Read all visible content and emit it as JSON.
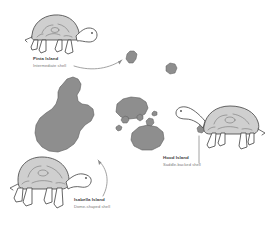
{
  "figure": {
    "type": "illustration-map",
    "background_color": "#ffffff",
    "island_fill_color": "#8e8e8e",
    "island_stroke_color": "#5d5d5d",
    "shell_fill_color": "#cfcfcf",
    "outline_color": "#4a4a4a",
    "label_title_color": "#3a3a3a",
    "label_sub_color": "#7c7c7c",
    "arrow_color": "#8a8a8a"
  },
  "labels": [
    {
      "id": "pinta",
      "island": "Pinta Island",
      "shell": "Intermediate shell",
      "position": "top-left"
    },
    {
      "id": "hood",
      "island": "Hood Island",
      "shell": "Saddle-backed shell",
      "position": "right"
    },
    {
      "id": "isabella",
      "island": "Isabella Island",
      "shell": "Dome-shaped shell",
      "position": "bottom-left"
    }
  ],
  "tortoises": [
    {
      "id": "pinta-tortoise",
      "facing": "right",
      "shell_type": "Intermediate shell"
    },
    {
      "id": "hood-tortoise",
      "facing": "left",
      "shell_type": "Saddle-backed shell"
    },
    {
      "id": "isabella-tortoise",
      "facing": "right",
      "shell_type": "Dome-shaped shell"
    }
  ],
  "islands": [
    {
      "id": "isabella-island",
      "size": "large",
      "role": "seahorse-shaped main island"
    },
    {
      "id": "santiago-island",
      "size": "medium"
    },
    {
      "id": "santa-cruz-island",
      "size": "medium"
    },
    {
      "id": "pinta-island",
      "size": "small"
    },
    {
      "id": "marchena-island",
      "size": "small"
    },
    {
      "id": "islet-a",
      "size": "tiny"
    },
    {
      "id": "islet-b",
      "size": "tiny"
    },
    {
      "id": "islet-c",
      "size": "tiny"
    },
    {
      "id": "islet-d",
      "size": "tiny"
    },
    {
      "id": "islet-e",
      "size": "tiny"
    },
    {
      "id": "hood-island",
      "size": "tiny"
    }
  ],
  "connectors": [
    {
      "id": "pinta-connector",
      "from": "pinta-tortoise",
      "to": "pinta-island",
      "style": "curved-arrow"
    },
    {
      "id": "isabella-connector",
      "from": "isabella-tortoise",
      "to": "isabella-island",
      "style": "curved-arrow"
    },
    {
      "id": "hood-connector",
      "from": "hood-tortoise",
      "to": "hood-island",
      "style": "straight-line"
    }
  ]
}
